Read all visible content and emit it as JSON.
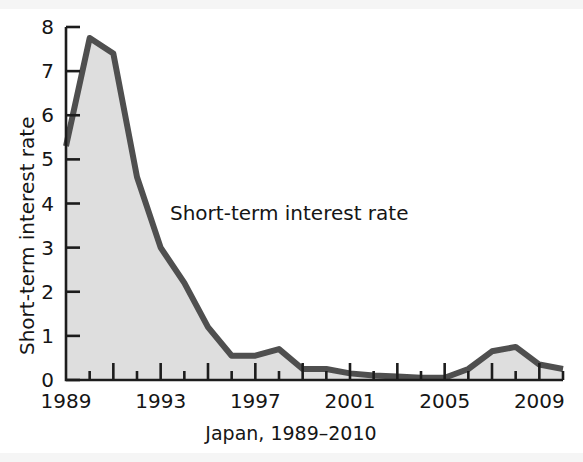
{
  "figure": {
    "background_color": "#ffffff",
    "annotation": "Short-term interest rate",
    "x_caption": "Japan, 1989–2010"
  },
  "chart_data": {
    "type": "area",
    "title": "",
    "subtitle": "",
    "xlabel": "Japan, 1989–2010",
    "ylabel": "Short-term interest rate",
    "annotations": [
      {
        "text": "Short-term interest rate",
        "x": 1992.6,
        "y": 4.0
      }
    ],
    "grid": false,
    "legend": "none",
    "line_color": "#4f4f4f",
    "fill_color": "#dedede",
    "axis_color": "#1c1c1c",
    "xlim": [
      1989,
      2010
    ],
    "ylim": [
      0,
      8
    ],
    "yticks": [
      0,
      1,
      2,
      3,
      4,
      5,
      6,
      7,
      8
    ],
    "ytick_labels": [
      "0",
      "1",
      "2",
      "3",
      "4",
      "5",
      "6",
      "7",
      "8"
    ],
    "xticks": [
      1989,
      1990,
      1991,
      1992,
      1993,
      1994,
      1995,
      1996,
      1997,
      1998,
      1999,
      2000,
      2001,
      2002,
      2003,
      2004,
      2005,
      2006,
      2007,
      2008,
      2009,
      2010
    ],
    "xtick_labels_shown": [
      "1989",
      "1993",
      "1997",
      "2001",
      "2005",
      "2009"
    ],
    "xtick_labels_at": [
      1989,
      1993,
      1997,
      2001,
      2005,
      2009
    ],
    "x": [
      1989,
      1990,
      1991,
      1992,
      1993,
      1994,
      1995,
      1996,
      1997,
      1998,
      1999,
      2000,
      2001,
      2002,
      2003,
      2004,
      2005,
      2006,
      2007,
      2008,
      2009,
      2010
    ],
    "values": [
      5.3,
      7.75,
      7.4,
      4.6,
      3.0,
      2.2,
      1.2,
      0.55,
      0.55,
      0.7,
      0.25,
      0.25,
      0.15,
      0.1,
      0.08,
      0.05,
      0.05,
      0.25,
      0.65,
      0.75,
      0.35,
      0.25
    ],
    "series_name": "Short-term interest rate"
  }
}
